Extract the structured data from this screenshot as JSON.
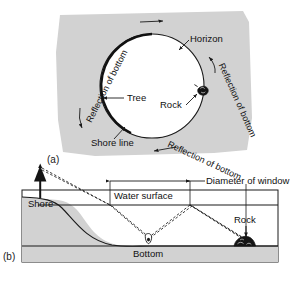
{
  "figure": {
    "panels": [
      {
        "tag": "(a)",
        "view": "overhead view of circular window seen from underwater",
        "labels": [
          {
            "name": "horizon",
            "text": "Horizon"
          },
          {
            "name": "tree",
            "text": "Tree"
          },
          {
            "name": "rock",
            "text": "Rock"
          },
          {
            "name": "shore-line",
            "text": "Shore line"
          },
          {
            "name": "reflection-of-bottom-upper-left",
            "text": "Reflection of bottom"
          },
          {
            "name": "reflection-of-bottom-right",
            "text": "Reflection of bottom"
          },
          {
            "name": "reflection-of-bottom-lower-right",
            "text": "Reflection of bottom"
          }
        ]
      },
      {
        "tag": "(b)",
        "view": "cross-section of shore, water surface and bottom",
        "labels": [
          {
            "name": "shore",
            "text": "Shore"
          },
          {
            "name": "water-surface",
            "text": "Water surface"
          },
          {
            "name": "diameter-of-window",
            "text": "Diameter of window"
          },
          {
            "name": "rock",
            "text": "Rock"
          },
          {
            "name": "bottom",
            "text": "Bottom"
          }
        ]
      }
    ]
  },
  "colors": {
    "panel_fill": "#d2d2d2",
    "water_fill": "#ffffff",
    "ground_fill": "#d2d2d2",
    "line": "#1a1a1a",
    "text": "#111111",
    "circle_fill": "#ffffff"
  }
}
